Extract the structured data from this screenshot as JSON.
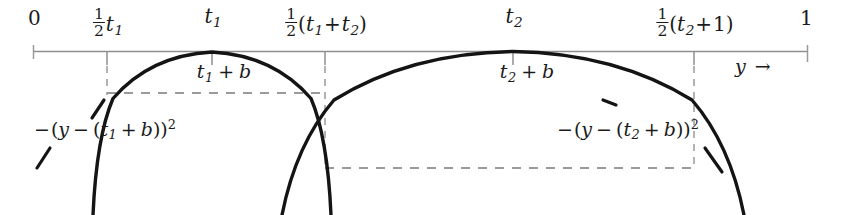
{
  "figure": {
    "kind": "math-diagram",
    "colors": {
      "ink": "#1b1b1b",
      "axis": "#8c8c8c",
      "dashed": "#9a9a9a",
      "background": "#ffffff"
    },
    "axis": {
      "name": "y-axis",
      "variable_label": "y →",
      "start_label": "0",
      "end_label": "1",
      "ticks": [
        {
          "id": "tick-zero",
          "x": 33,
          "label": "0",
          "label_x": 36,
          "has_stem": false
        },
        {
          "id": "tick-half-t1",
          "x": 107,
          "label": "½ t₁",
          "label_x": 107,
          "has_stem": true
        },
        {
          "id": "tick-t1",
          "x": 212,
          "label": "t₁",
          "label_x": 212,
          "has_stem": true
        },
        {
          "id": "tick-half-t1-t2",
          "x": 325,
          "label": "½(t₁+t₂)",
          "label_x": 325,
          "has_stem": true
        },
        {
          "id": "tick-t2",
          "x": 513,
          "label": "t₂",
          "label_x": 513,
          "has_stem": true
        },
        {
          "id": "tick-half-t2-1",
          "x": 694,
          "label": "½(t₂+1)",
          "label_x": 694,
          "has_stem": true
        },
        {
          "id": "tick-one",
          "x": 808,
          "label": "1",
          "label_x": 806,
          "has_stem": false
        }
      ]
    },
    "tick_labels": {
      "zero": "0",
      "half_t1": {
        "frac_num": "1",
        "frac_den": "2",
        "body": "t",
        "sub": "1"
      },
      "t1": {
        "body": "t",
        "sub": "1"
      },
      "half_t1_plus_t2": {
        "frac_num": "1",
        "frac_den": "2",
        "open": "(",
        "a": "t",
        "a_sub": "1",
        "plus": "+",
        "b": "t",
        "b_sub": "2",
        "close": ")"
      },
      "t2": {
        "body": "t",
        "sub": "2"
      },
      "half_t2_plus_1": {
        "frac_num": "1",
        "frac_den": "2",
        "open": "(",
        "a": "t",
        "a_sub": "2",
        "plus": "+",
        "b": "1",
        "close": ")"
      },
      "one": "1"
    },
    "curves": [
      {
        "id": "parabola-1",
        "peak_label": {
          "a": "t",
          "a_sub": "1",
          "plus": "+",
          "b": "b"
        },
        "peak_label_text": "t₁ + b",
        "formula": {
          "neg": "−",
          "open1": "(",
          "y": "y",
          "minus": "−",
          "open2": "(",
          "a": "t",
          "a_sub": "1",
          "plus": "+",
          "b": "b",
          "close2": ")",
          "close1": ")",
          "power": "2"
        },
        "formula_text": "−(y − (t₁ + b))²",
        "vertex_x": 212,
        "vertex_y": 52,
        "left_x": 107,
        "right_x": 325
      },
      {
        "id": "parabola-2",
        "peak_label": {
          "a": "t",
          "a_sub": "2",
          "plus": "+",
          "b": "b"
        },
        "peak_label_text": "t₂ + b",
        "formula": {
          "neg": "−",
          "open1": "(",
          "y": "y",
          "minus": "−",
          "open2": "(",
          "a": "t",
          "a_sub": "2",
          "plus": "+",
          "b": "b",
          "close2": ")",
          "close1": ")",
          "power": "2"
        },
        "formula_text": "−(y − (t₂ + b))²",
        "vertex_x": 513,
        "vertex_y": 52,
        "left_x": 325,
        "right_x": 694
      }
    ],
    "guides": [
      {
        "id": "dashed-level-1",
        "x1": 107,
        "x2": 325,
        "y": 93
      },
      {
        "id": "dashed-level-2",
        "x1": 325,
        "x2": 694,
        "y": 168
      }
    ],
    "arrow": {
      "label_var": "y",
      "glyph": "→"
    }
  }
}
